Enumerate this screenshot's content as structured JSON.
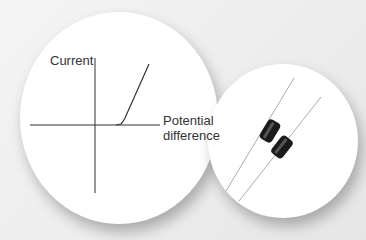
{
  "graph": {
    "y_axis_label": "Current",
    "x_axis_label_line1": "Potential",
    "x_axis_label_line2": "difference",
    "curve_type": "diode I-V characteristic"
  },
  "photo": {
    "subject": "two axial-lead diodes",
    "body_color": "#1a1a1a"
  }
}
